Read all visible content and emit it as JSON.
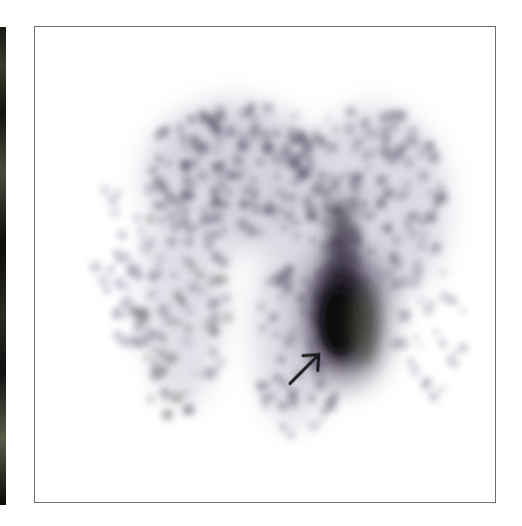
{
  "figure": {
    "colors": {
      "background": "#ffffff",
      "frame": "#6e6e6e",
      "uptake_dark": "#1a141c",
      "uptake_mid": "#5a5268",
      "uptake_light": "#a8a4b8",
      "arrow": "#1a1a1a"
    },
    "annotations": [
      {
        "type": "arrow-icon",
        "points_to": "focal uptake"
      }
    ]
  }
}
